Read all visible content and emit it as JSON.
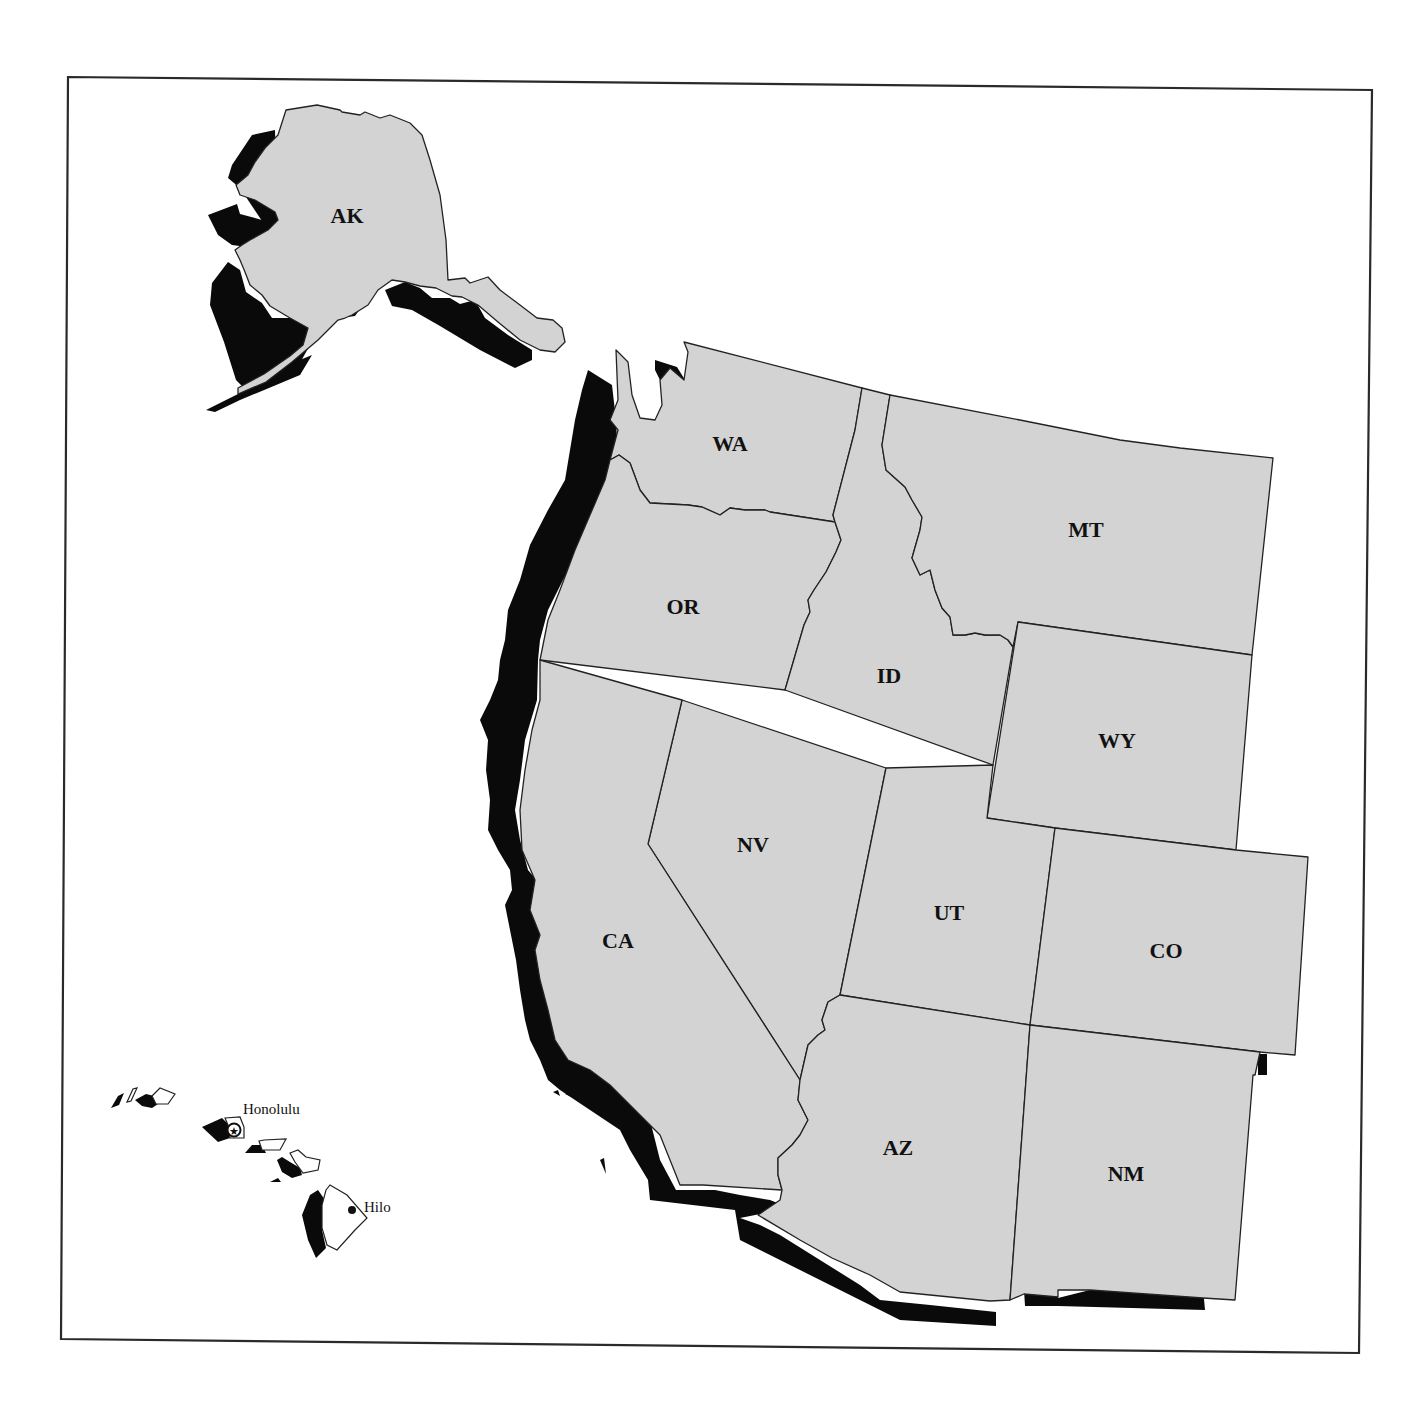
{
  "map": {
    "title": "",
    "colors": {
      "land": "#d3d3d3",
      "shadow": "#0a0a0a",
      "border": "#222222",
      "background": "#ffffff",
      "hawaii_islands": "#ffffff"
    },
    "states": [
      {
        "code": "AK",
        "label": "AK"
      },
      {
        "code": "WA",
        "label": "WA"
      },
      {
        "code": "OR",
        "label": "OR"
      },
      {
        "code": "ID",
        "label": "ID"
      },
      {
        "code": "MT",
        "label": "MT"
      },
      {
        "code": "WY",
        "label": "WY"
      },
      {
        "code": "NV",
        "label": "NV"
      },
      {
        "code": "CA",
        "label": "CA"
      },
      {
        "code": "UT",
        "label": "UT"
      },
      {
        "code": "CO",
        "label": "CO"
      },
      {
        "code": "AZ",
        "label": "AZ"
      },
      {
        "code": "NM",
        "label": "NM"
      }
    ],
    "cities": [
      {
        "name": "Honolulu",
        "marker": "star-in-circle",
        "role": "capital"
      },
      {
        "name": "Hilo",
        "marker": "dot"
      }
    ]
  }
}
